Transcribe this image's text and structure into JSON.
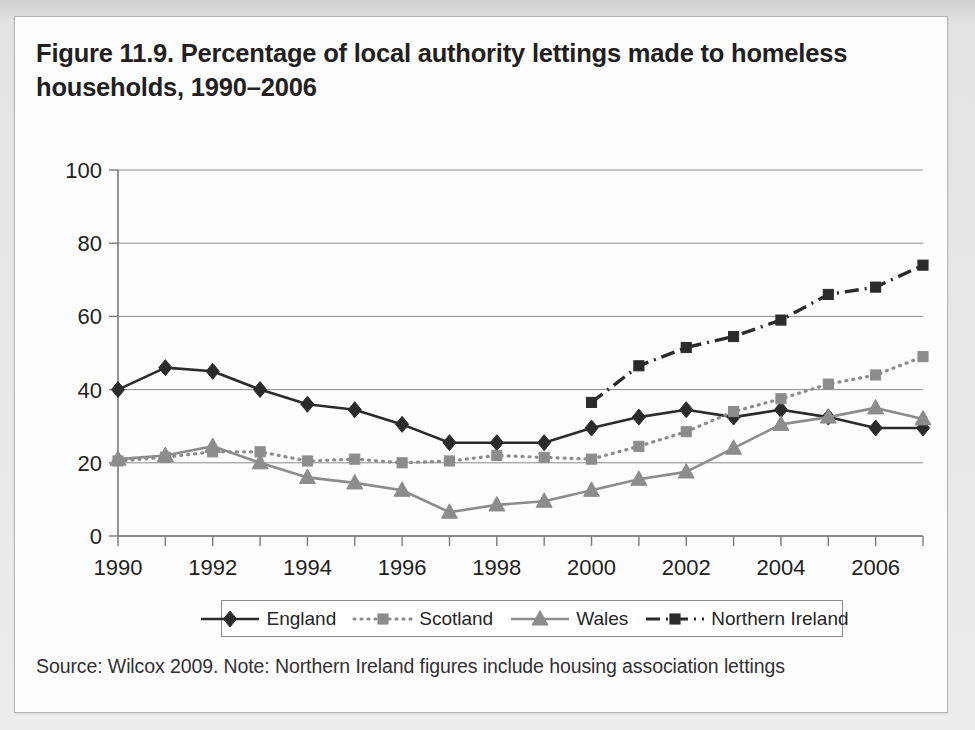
{
  "figure": {
    "title": "Figure 11.9. Percentage of local authority lettings made to homeless households, 1990–2006",
    "source_note": "Source: Wilcox 2009. Note: Northern Ireland figures include housing association lettings"
  },
  "colors": {
    "dark": "#2b2b2b",
    "grey": "#8c8c8c",
    "axis": "#7a7a7a",
    "grid": "#8a8a8a",
    "card_bg": "#fdfdfd",
    "page_bg": "#e6e6e6",
    "text": "#231f20"
  },
  "legend": {
    "entries": [
      {
        "label": "England",
        "marker": "diamond",
        "color": "#2b2b2b",
        "dash": "solid"
      },
      {
        "label": "Scotland",
        "marker": "square",
        "color": "#8c8c8c",
        "dash": "dotted"
      },
      {
        "label": "Wales",
        "marker": "triangle",
        "color": "#8c8c8c",
        "dash": "solid"
      },
      {
        "label": "Northern Ireland",
        "marker": "square",
        "color": "#2b2b2b",
        "dash": "dashdot"
      }
    ]
  },
  "chart_data": {
    "type": "line",
    "title": "Figure 11.9. Percentage of local authority lettings made to homeless households, 1990–2006",
    "xlabel": "",
    "ylabel": "",
    "ylim": [
      0,
      100
    ],
    "yticks": [
      0,
      20,
      40,
      60,
      80,
      100
    ],
    "xlim": [
      1990,
      2007
    ],
    "xticks": [
      1990,
      1991,
      1992,
      1993,
      1994,
      1995,
      1996,
      1997,
      1998,
      1999,
      2000,
      2001,
      2002,
      2003,
      2004,
      2005,
      2006,
      2007
    ],
    "xticklabels": [
      "1990",
      "",
      "1992",
      "",
      "1994",
      "",
      "1996",
      "",
      "1998",
      "",
      "2000",
      "",
      "2002",
      "",
      "2004",
      "",
      "2006",
      ""
    ],
    "grid": "horizontal",
    "legend_position": "bottom",
    "x": [
      1990,
      1991,
      1992,
      1993,
      1994,
      1995,
      1996,
      1997,
      1998,
      1999,
      2000,
      2001,
      2002,
      2003,
      2004,
      2005,
      2006,
      2007
    ],
    "series": [
      {
        "name": "England",
        "marker": "diamond",
        "color": "#2b2b2b",
        "dash": "solid",
        "x": [
          1990,
          1991,
          1992,
          1993,
          1994,
          1995,
          1996,
          1997,
          1998,
          1999,
          2000,
          2001,
          2002,
          2003,
          2004,
          2005,
          2006,
          2007
        ],
        "values": [
          40,
          46,
          45,
          40,
          36,
          34.5,
          30.5,
          25.5,
          25.5,
          25.5,
          29.5,
          32.5,
          34.5,
          32.5,
          34.5,
          32.5,
          29.5,
          29.5
        ]
      },
      {
        "name": "Scotland",
        "marker": "square",
        "color": "#8c8c8c",
        "dash": "dotted",
        "x": [
          1990,
          1991,
          1992,
          1993,
          1994,
          1995,
          1996,
          1997,
          1998,
          1999,
          2000,
          2001,
          2002,
          2003,
          2004,
          2005,
          2006,
          2007
        ],
        "values": [
          20.5,
          21.5,
          23,
          23,
          20.5,
          21,
          20,
          20.5,
          22,
          21.5,
          21,
          24.5,
          28.5,
          34,
          37.5,
          41.5,
          44,
          49
        ]
      },
      {
        "name": "Wales",
        "marker": "triangle",
        "color": "#8c8c8c",
        "dash": "solid",
        "x": [
          1990,
          1991,
          1992,
          1993,
          1994,
          1995,
          1996,
          1997,
          1998,
          1999,
          2000,
          2001,
          2002,
          2003,
          2004,
          2005,
          2006,
          2007
        ],
        "values": [
          21,
          22,
          24.5,
          20,
          16,
          14.5,
          12.5,
          6.5,
          8.5,
          9.5,
          12.5,
          15.5,
          17.5,
          24,
          30.5,
          32.5,
          35,
          32
        ]
      },
      {
        "name": "Northern Ireland",
        "marker": "square",
        "color": "#2b2b2b",
        "dash": "dashdot",
        "x": [
          2000,
          2001,
          2002,
          2003,
          2004,
          2005,
          2006,
          2007
        ],
        "values": [
          36.5,
          46.5,
          51.5,
          54.5,
          59,
          66,
          68,
          74
        ]
      }
    ]
  }
}
